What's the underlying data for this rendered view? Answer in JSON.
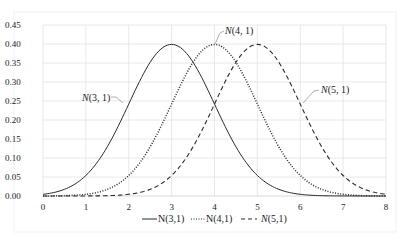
{
  "chart_data": {
    "type": "line",
    "title": "",
    "xlabel": "",
    "ylabel": "",
    "xlim": [
      0,
      8
    ],
    "ylim": [
      0,
      0.45
    ],
    "grid": true,
    "legend_position": "bottom",
    "x_ticks": [
      "0",
      "1",
      "2",
      "3",
      "4",
      "5",
      "6",
      "7",
      "8"
    ],
    "y_ticks": [
      "0.00",
      "0.05",
      "0.10",
      "0.15",
      "0.20",
      "0.25",
      "0.30",
      "0.35",
      "0.40",
      "0.45"
    ],
    "x": [
      0,
      0.5,
      1,
      1.5,
      2,
      2.5,
      3,
      3.5,
      4,
      4.5,
      5,
      5.5,
      6,
      6.5,
      7,
      7.5,
      8
    ],
    "series": [
      {
        "name": "N(3,1)",
        "style": "solid",
        "values": [
          0.0044,
          0.0175,
          0.054,
          0.1295,
          0.242,
          0.3521,
          0.3989,
          0.3521,
          0.242,
          0.1295,
          0.054,
          0.0175,
          0.0044,
          0.0009,
          0.0001,
          0.0,
          0.0
        ]
      },
      {
        "name": "N(4,1)",
        "style": "dotted",
        "values": [
          0.0001,
          0.0009,
          0.0044,
          0.0175,
          0.054,
          0.1295,
          0.242,
          0.3521,
          0.3989,
          0.3521,
          0.242,
          0.1295,
          0.054,
          0.0175,
          0.0044,
          0.0009,
          0.0001
        ]
      },
      {
        "name": "N(5,1)",
        "style": "dashed",
        "values": [
          0.0,
          0.0,
          0.0001,
          0.0009,
          0.0044,
          0.0175,
          0.054,
          0.1295,
          0.242,
          0.3521,
          0.3989,
          0.3521,
          0.242,
          0.1295,
          0.054,
          0.0175,
          0.0044
        ]
      }
    ],
    "annotations": [
      {
        "text_italic": "N",
        "text_rest": "(3, 1)",
        "target_series": "N(3,1)"
      },
      {
        "text_italic": "N",
        "text_rest": "(4, 1)",
        "target_series": "N(4,1)"
      },
      {
        "text_italic": "N",
        "text_rest": "(5, 1)",
        "target_series": "N(5,1)"
      }
    ],
    "legend": [
      {
        "label_italic": "",
        "label_rest": "N(3,1)",
        "style": "solid"
      },
      {
        "label_italic": "",
        "label_rest": "N(4,1)",
        "style": "dotted"
      },
      {
        "label_italic": "N",
        "label_rest": "(5,1)",
        "style": "dashed"
      }
    ]
  },
  "colors": {
    "line": "#2b2b2b",
    "grid": "#e2e2e2",
    "background": "#ffffff"
  }
}
